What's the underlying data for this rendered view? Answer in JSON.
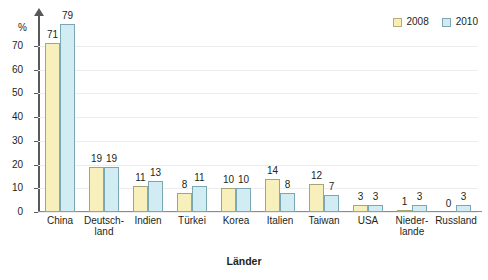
{
  "chart_data": {
    "type": "bar",
    "title": "",
    "subtitle": "",
    "xlabel": "Länder",
    "ylabel": "%",
    "ylim": [
      0,
      80
    ],
    "yticks": [
      0,
      10,
      20,
      30,
      40,
      50,
      60,
      70
    ],
    "grid": true,
    "legend_position": "top-right",
    "categories": [
      "China",
      "Deutsch-\nland",
      "Indien",
      "Türkei",
      "Korea",
      "Italien",
      "Taiwan",
      "USA",
      "Nieder-\nlande",
      "Russland"
    ],
    "series": [
      {
        "name": "2008",
        "color": "#f8f0bc",
        "values": [
          71,
          19,
          11,
          8,
          10,
          14,
          12,
          3,
          1,
          0
        ]
      },
      {
        "name": "2010",
        "color": "#d2ecf3",
        "values": [
          79,
          19,
          13,
          11,
          10,
          8,
          7,
          3,
          3,
          3
        ]
      }
    ]
  },
  "legend": {
    "items": [
      {
        "label": "2008",
        "swatch": "s2008"
      },
      {
        "label": "2010",
        "swatch": "s2010"
      }
    ]
  },
  "axes": {
    "y_unit": "%",
    "x_title": "Länder"
  },
  "colors": {
    "series_2008": "#f8f0bc",
    "series_2010": "#d2ecf3",
    "border_2008": "#aaa475",
    "border_2010": "#7ba7b3",
    "axis": "#58595b",
    "grid": "#ededed",
    "text": "#231f20",
    "background": "#ffffff"
  }
}
